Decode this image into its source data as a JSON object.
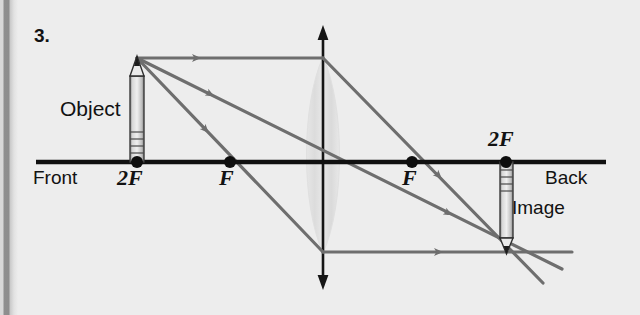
{
  "figure": {
    "number_label": "3.",
    "type": "converging-lens-ray-diagram",
    "caption_labels": {
      "object": "Object",
      "image": "Image",
      "front": "Front",
      "back": "Back"
    },
    "axis_points": [
      {
        "name": "object-focal-2f-left",
        "label": "2F",
        "x": 136,
        "y": 162
      },
      {
        "name": "focal-point-left",
        "label": "F",
        "x": 230,
        "y": 162
      },
      {
        "name": "focal-point-right",
        "label": "F",
        "x": 412,
        "y": 162
      },
      {
        "name": "image-focal-2f-right",
        "label": "2F",
        "x": 505,
        "y": 162
      }
    ],
    "optical_axis": {
      "x1": 36,
      "x2": 606,
      "y": 162
    },
    "lens": {
      "center_x": 323,
      "top_y": 27,
      "bottom_y": 287,
      "body_top_y": 57,
      "body_bottom_y": 253,
      "half_width": 21
    },
    "object_pencil": {
      "x": 137,
      "base_y": 162,
      "tip_y": 56,
      "orientation": "upright"
    },
    "image_pencil": {
      "x": 506,
      "base_y": 162,
      "tip_y": 253,
      "orientation": "inverted"
    },
    "rays": [
      {
        "name": "parallel-ray-in",
        "from": [
          137,
          58
        ],
        "to": [
          323,
          58
        ]
      },
      {
        "name": "parallel-ray-out",
        "from": [
          323,
          58
        ],
        "to": [
          540,
          280
        ]
      },
      {
        "name": "center-ray",
        "from": [
          137,
          58
        ],
        "to": [
          560,
          268
        ]
      },
      {
        "name": "focal-ray-in",
        "from": [
          137,
          58
        ],
        "to": [
          323,
          252
        ]
      },
      {
        "name": "focal-ray-out",
        "from": [
          323,
          252
        ],
        "to": [
          570,
          252
        ]
      }
    ],
    "colors": {
      "background": "#ededed",
      "ink": "#121212",
      "ray": "#6e6e6e",
      "lens_fill": "#e3e3e3",
      "page_edge": "#8d8d8d"
    }
  }
}
